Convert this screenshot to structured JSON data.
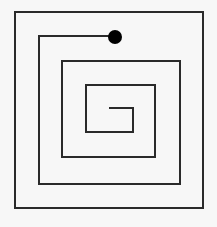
{
  "diagram": {
    "type": "square-spiral-maze",
    "background": "#f7f7f7",
    "stroke_color": "#2a2a2a",
    "stroke_width": 2,
    "outer_frame": {
      "x": 15,
      "y": 12,
      "width": 188,
      "height": 196
    },
    "spiral_points": [
      [
        115,
        36
      ],
      [
        39,
        36
      ],
      [
        39,
        184
      ],
      [
        180,
        184
      ],
      [
        180,
        61
      ],
      [
        62,
        61
      ],
      [
        62,
        157
      ],
      [
        155,
        157
      ],
      [
        155,
        85
      ],
      [
        86,
        85
      ],
      [
        86,
        132
      ],
      [
        133,
        132
      ],
      [
        133,
        108
      ],
      [
        109,
        108
      ]
    ],
    "start_dot": {
      "cx": 115,
      "cy": 37,
      "r": 7,
      "color": "#000000"
    }
  }
}
